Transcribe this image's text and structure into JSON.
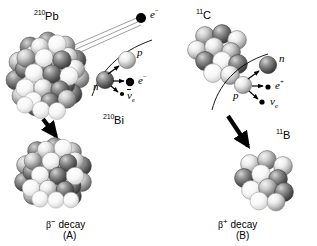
{
  "figure": {
    "type": "beta-decay-comparison-diagram",
    "background": "#ffffff",
    "width": 317,
    "height": 246
  },
  "panels": [
    {
      "id": "A",
      "panel_label": "(A)",
      "caption": "decay",
      "caption_symbol": "β",
      "caption_superscript": "−",
      "caption_full": "β− decay",
      "parent_nucleus": {
        "label": "Pb",
        "mass_number": "210",
        "full": "210Pb",
        "nucleon_count_drawn": 46,
        "style": "large-sphere-cluster"
      },
      "daughter_nucleus": {
        "label": "Bi",
        "mass_number": "210",
        "full": "210Bi",
        "nucleon_count_drawn": 38,
        "style": "large-sphere-cluster"
      },
      "emitted_particle": {
        "name": "electron",
        "symbol": "e",
        "charge_superscript": "−",
        "full": "e−",
        "render": "black-filled-dot-with-trajectory-lines"
      },
      "inset": {
        "description": "magnified neutron decay",
        "reaction": "n → p + e− + ν̄e",
        "initial": {
          "symbol": "n",
          "full": "n",
          "style": "shaded-sphere-dark"
        },
        "products": [
          {
            "symbol": "p",
            "full": "p",
            "style": "shaded-sphere-light",
            "render": "sphere"
          },
          {
            "symbol": "e",
            "charge_superscript": "−",
            "full": "e−",
            "render": "black-dot"
          },
          {
            "symbol": "ν",
            "overline": true,
            "sub": "e",
            "full": "ν̄e",
            "render": "small-black-dot"
          }
        ]
      }
    },
    {
      "id": "B",
      "panel_label": "(B)",
      "caption": "decay",
      "caption_symbol": "β",
      "caption_superscript": "+",
      "caption_full": "β+ decay",
      "parent_nucleus": {
        "label": "C",
        "mass_number": "11",
        "full": "11C",
        "nucleon_count_drawn": 11,
        "style": "small-sphere-cluster"
      },
      "daughter_nucleus": {
        "label": "B",
        "mass_number": "11",
        "full": "11B",
        "nucleon_count_drawn": 11,
        "style": "small-sphere-cluster"
      },
      "inset": {
        "description": "magnified proton decay",
        "reaction": "p → n + e+ + νe",
        "initial": {
          "symbol": "p",
          "full": "p",
          "style": "shaded-sphere-light"
        },
        "products": [
          {
            "symbol": "n",
            "full": "n",
            "style": "shaded-sphere-dark",
            "render": "sphere"
          },
          {
            "symbol": "e",
            "charge_superscript": "+",
            "full": "e+",
            "render": "small-dot"
          },
          {
            "symbol": "ν",
            "overline": false,
            "sub": "e",
            "full": "νe",
            "render": "small-black-dot"
          }
        ]
      }
    }
  ],
  "colors": {
    "stroke": "#000000",
    "background": "#ffffff",
    "nucleon_light": "#e8e8e8",
    "nucleon_mid": "#b4b4b4",
    "nucleon_dark": "#4a4a4a",
    "arrow": "#000000"
  }
}
